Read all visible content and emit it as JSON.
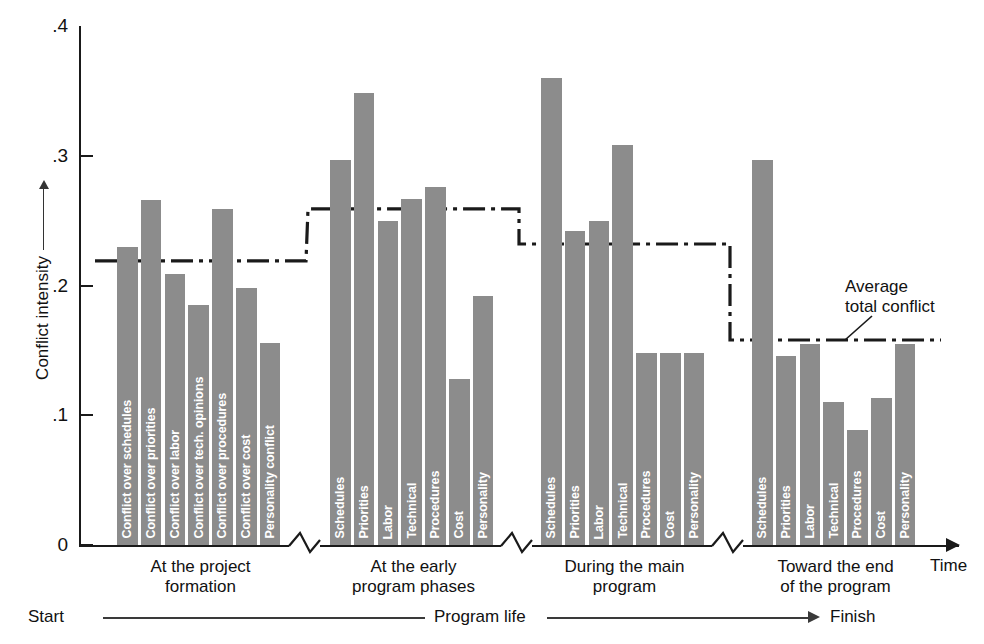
{
  "chart_data": {
    "type": "bar",
    "title": "",
    "xlabel": "Time",
    "ylabel": "Conflict intensity",
    "ylim": [
      0,
      0.4
    ],
    "ytick_labels": [
      ".4",
      ".3",
      ".2",
      ".1",
      "0"
    ],
    "ytick_values": [
      0.4,
      0.3,
      0.2,
      0.1,
      0.0
    ],
    "grid": false,
    "legend": "none",
    "bar_color": "#8c8c8c",
    "axis_color": "#1a1a1a",
    "groups": [
      {
        "name": "At the project formation",
        "label_line1": "At the project",
        "label_line2": "formation",
        "average_total_conflict": 0.219,
        "categories": [
          "Conflict over schedules",
          "Conflict over priorities",
          "Conflict over labor",
          "Conflict over tech. opinions",
          "Conflict over procedures",
          "Conflict over cost",
          "Personality conflict"
        ],
        "values": [
          0.23,
          0.266,
          0.209,
          0.185,
          0.259,
          0.198,
          0.156
        ]
      },
      {
        "name": "At the early program phases",
        "label_line1": "At the early",
        "label_line2": "program phases",
        "average_total_conflict": 0.259,
        "categories": [
          "Schedules",
          "Priorities",
          "Labor",
          "Technical",
          "Procedures",
          "Cost",
          "Personality"
        ],
        "values": [
          0.297,
          0.348,
          0.25,
          0.267,
          0.276,
          0.128,
          0.192
        ]
      },
      {
        "name": "During the main program",
        "label_line1": "During the main",
        "label_line2": "program",
        "average_total_conflict": 0.232,
        "categories": [
          "Schedules",
          "Priorities",
          "Labor",
          "Technical",
          "Procedures",
          "Cost",
          "Personality"
        ],
        "values": [
          0.36,
          0.242,
          0.25,
          0.308,
          0.148,
          0.148,
          0.148
        ]
      },
      {
        "name": "Toward the end of the program",
        "label_line1": "Toward the end",
        "label_line2": "of the program",
        "average_total_conflict": 0.158,
        "categories": [
          "Schedules",
          "Priorities",
          "Labor",
          "Technical",
          "Procedures",
          "Cost",
          "Personality"
        ],
        "values": [
          0.297,
          0.146,
          0.155,
          0.11,
          0.089,
          0.113,
          0.155
        ]
      }
    ],
    "annotations": [
      {
        "id": "average-total-conflict",
        "line1": "Average",
        "line2": "total conflict"
      }
    ]
  },
  "axis": {
    "y_title": "Conflict intensity",
    "x_title": "Time"
  },
  "timeline": {
    "start_label": "Start",
    "middle_label": "Program life",
    "end_label": "Finish"
  }
}
